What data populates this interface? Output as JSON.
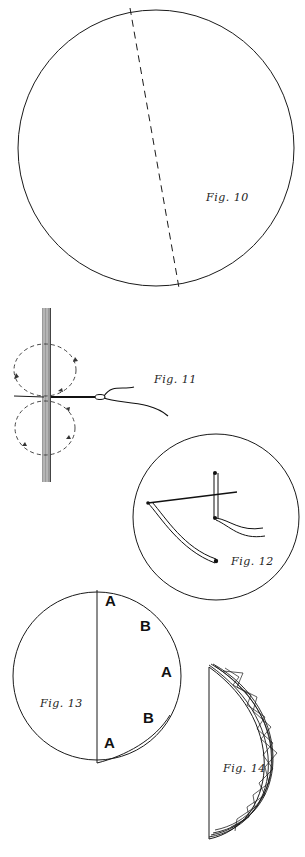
{
  "page": {
    "background": "#ffffff",
    "ink_color": "#1a1a1a"
  },
  "figures": [
    {
      "id": "fig10",
      "caption": "Fig. 10",
      "description": "Circle with dashed diameter line (fold line)"
    },
    {
      "id": "fig11",
      "caption": "Fig. 11",
      "description": "Vertical strip with needle and thread passing through; dashed figure-eight loops with arrows"
    },
    {
      "id": "fig12",
      "caption": "Fig. 12",
      "description": "Circle showing needle with thread making a stitch"
    },
    {
      "id": "fig13",
      "caption": "Fig. 13",
      "description": "Circle folded along vertical line with points labeled",
      "labels": [
        "A",
        "B",
        "A",
        "B",
        "A"
      ]
    },
    {
      "id": "fig14",
      "caption": "Fig. 14",
      "description": "Half circle with gathered, overlapping curved edge"
    }
  ]
}
